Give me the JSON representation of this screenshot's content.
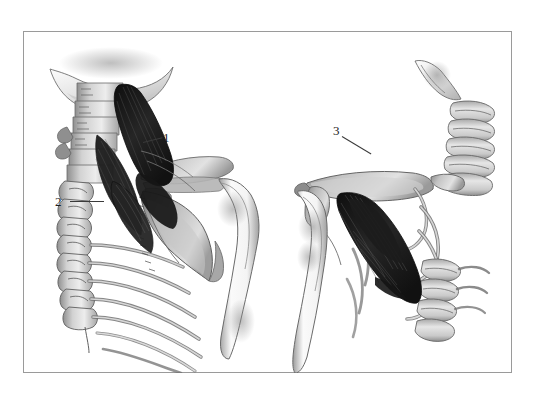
{
  "figure": {
    "kind": "anatomical-illustration",
    "style": "grayscale-pen-and-wash",
    "background_color": "#ffffff",
    "frame_color": "#9a9a9a",
    "ink_color": "#3a3a3a",
    "muscle_dark_color": "#1a1a1a",
    "bone_light_color": "#f2f2f2",
    "bone_mid_color": "#b9b9b9",
    "bone_shadow_color": "#8d8d8d"
  },
  "callouts": [
    {
      "id": "1",
      "label": "1",
      "view": "posterior",
      "target": "upper-muscle-belly"
    },
    {
      "id": "2",
      "label": "2",
      "view": "posterior",
      "target": "cervical-vertebra"
    },
    {
      "id": "3",
      "label": "3",
      "view": "anterior",
      "target": "clavicle-muscle-origin"
    }
  ],
  "views": [
    {
      "id": "left",
      "orientation": "posterior",
      "structures": [
        "occipital-bone",
        "cervical-spine",
        "thoracic-spine",
        "ribs",
        "scapula",
        "acromion",
        "humerus",
        "levator-scapulae-muscle"
      ]
    },
    {
      "id": "right",
      "orientation": "anterior",
      "structures": [
        "mandible",
        "cervical-spine",
        "clavicle",
        "ribs",
        "scapula",
        "humerus",
        "muscle-fibers"
      ]
    }
  ]
}
